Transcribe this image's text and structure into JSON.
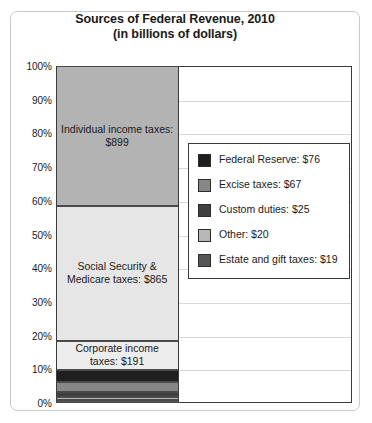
{
  "chart_data": {
    "type": "bar",
    "title": "Sources of Federal Revenue, 2010",
    "subtitle": "(in billions of dollars)",
    "xlabel": "",
    "ylabel": "",
    "ylim": [
      0,
      100
    ],
    "grid": true,
    "legend_position": "inside-right",
    "y_tick_labels": [
      "100%",
      "90%",
      "80%",
      "70%",
      "60%",
      "50%",
      "40%",
      "30%",
      "20%",
      "10%",
      "0%"
    ],
    "y_tick_values": [
      100,
      90,
      80,
      70,
      60,
      50,
      40,
      30,
      20,
      10,
      0
    ],
    "categories": [
      "Federal revenue 2010"
    ],
    "stacked": true,
    "units": "billions of dollars",
    "total": 2163,
    "series": [
      {
        "name": "Individual income taxes",
        "label": "Individual income taxes: $899",
        "value": 899,
        "percent": 41.6,
        "color": "#b3b3b3",
        "in_legend": false
      },
      {
        "name": "Social Security & Medicare taxes",
        "label": "Social Security & Medicare taxes: $865",
        "value": 865,
        "percent": 40.0,
        "color": "#e6e6e6",
        "in_legend": false
      },
      {
        "name": "Corporate income taxes",
        "label": "Corporate income taxes: $191",
        "value": 191,
        "percent": 8.8,
        "color": "#ededed",
        "in_legend": false
      },
      {
        "name": "Federal Reserve",
        "label": "Federal Reserve: $76",
        "value": 76,
        "percent": 3.5,
        "color": "#1f1f1f",
        "in_legend": true
      },
      {
        "name": "Excise taxes",
        "label": "Excise taxes: $67",
        "value": 67,
        "percent": 3.1,
        "color": "#878787",
        "in_legend": true
      },
      {
        "name": "Custom duties",
        "label": "Custom duties: $25",
        "value": 25,
        "percent": 1.2,
        "color": "#3f3f3f",
        "in_legend": true
      },
      {
        "name": "Other",
        "label": "Other: $20",
        "value": 20,
        "percent": 0.9,
        "color": "#b8b8b8",
        "in_legend": true
      },
      {
        "name": "Estate and gift taxes",
        "label": "Estate and gift taxes: $19",
        "value": 19,
        "percent": 0.9,
        "color": "#555555",
        "in_legend": true
      }
    ],
    "legend": [
      {
        "label": "Federal Reserve: $76",
        "color": "#1f1f1f"
      },
      {
        "label": "Excise taxes: $67",
        "color": "#878787"
      },
      {
        "label": "Custom duties: $25",
        "color": "#3f3f3f"
      },
      {
        "label": "Other: $20",
        "color": "#b8b8b8"
      },
      {
        "label": "Estate and gift taxes: $19",
        "color": "#555555"
      }
    ]
  }
}
